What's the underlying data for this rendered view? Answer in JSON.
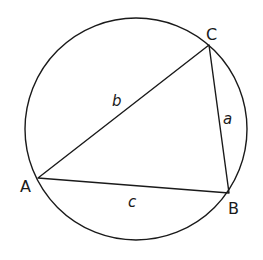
{
  "diagram": {
    "type": "triangle inscribed in circle",
    "circle": {
      "cx": 136,
      "cy": 129,
      "r": 111
    },
    "vertices": [
      {
        "label": "A",
        "x": 38,
        "y": 178,
        "lx": 20,
        "ly": 192
      },
      {
        "label": "B",
        "x": 229,
        "y": 193,
        "lx": 228,
        "ly": 214
      },
      {
        "label": "C",
        "x": 209,
        "y": 45,
        "lx": 206,
        "ly": 40
      }
    ],
    "sides": [
      {
        "label": "b",
        "between": "A-C",
        "lx": 112,
        "ly": 106
      },
      {
        "label": "a",
        "between": "C-B",
        "lx": 223,
        "ly": 124
      },
      {
        "label": "c",
        "between": "A-B",
        "lx": 128,
        "ly": 207
      }
    ],
    "stroke_color": "#1a1a1a"
  }
}
